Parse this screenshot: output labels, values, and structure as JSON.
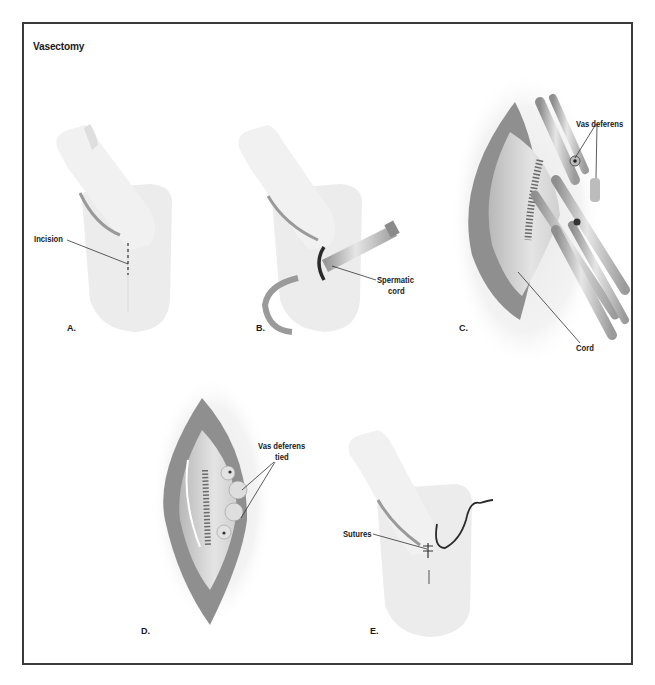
{
  "figure": {
    "title": "Vasectomy",
    "colors": {
      "frame": "#3a3a3a",
      "skin_light": "#efefef",
      "skin_mid": "#dcdcdc",
      "tissue_dark": "#8a8a8a",
      "instrument": "#c4c4c4",
      "suture": "#2a2a2a"
    },
    "panels": [
      {
        "id": "A",
        "letter": "A.",
        "callouts": [
          {
            "text": "Incision"
          }
        ]
      },
      {
        "id": "B",
        "letter": "B.",
        "callouts": [
          {
            "text": "Spermatic cord"
          }
        ]
      },
      {
        "id": "C",
        "letter": "C.",
        "callouts": [
          {
            "text": "Vas deferens"
          },
          {
            "text": "Cord"
          }
        ]
      },
      {
        "id": "D",
        "letter": "D.",
        "callouts": [
          {
            "text": "Vas deferens tied"
          }
        ]
      },
      {
        "id": "E",
        "letter": "E.",
        "callouts": [
          {
            "text": "Sutures"
          }
        ]
      }
    ]
  },
  "labels": {
    "incision": "Incision",
    "spermatic_line1": "Spermatic",
    "spermatic_line2": "cord",
    "vas_deferens": "Vas deferens",
    "cord": "Cord",
    "vas_tied_line1": "Vas deferens",
    "vas_tied_line2": "tied",
    "sutures": "Sutures"
  }
}
